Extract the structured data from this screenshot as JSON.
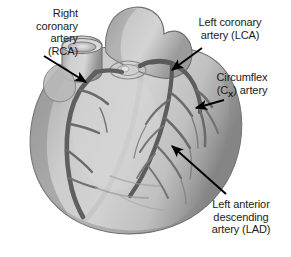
{
  "figure": {
    "background_color": "#ffffff",
    "tissue_color": "#c8c8c8",
    "shadow_color": "#8a8a8a",
    "artery_color": "#6e6e6e",
    "artery_dark_color": "#5a5a5a",
    "outline_color": "#555555",
    "arrow_color": "#000000",
    "text_color": "#1a1a1a"
  },
  "labels": {
    "rca": {
      "name": "Right coronary artery (RCA)",
      "line1": "Right",
      "line2": "coronary",
      "line3": "artery",
      "line4": "(RCA)",
      "text": "Right\ncoronary\nartery\n(RCA)"
    },
    "lca": {
      "name": "Left coronary artery (LCA)",
      "line1": "Left coronary",
      "line2": "artery (LCA)",
      "text": "Left coronary\nartery (LCA)"
    },
    "cx": {
      "name": "Circumflex (CX) artery",
      "line1": "Circumflex",
      "line2_prefix": "(C",
      "line2_sub": "X",
      "line2_suffix": ") artery"
    },
    "lad": {
      "name": "Left anterior descending artery (LAD)",
      "line1": "Left anterior",
      "line2": "descending",
      "line3": "artery (LAD)",
      "text": "Left anterior\ndescending\nartery (LAD)"
    }
  },
  "anatomy": {
    "aorta": "aorta stump",
    "pulmonary_trunk": "pulmonary trunk",
    "left_ventricle": "left ventricle",
    "right_ventricle": "right ventricle",
    "apex": "cardiac apex"
  }
}
